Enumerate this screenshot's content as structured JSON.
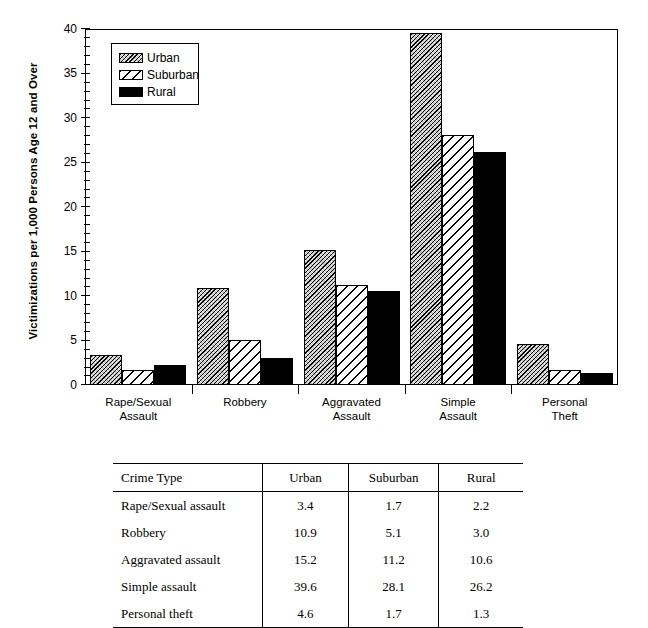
{
  "chart_data": {
    "type": "bar",
    "title": "",
    "subtitle": "",
    "xlabel": "",
    "ylabel": "Victimizations per 1,000 Persons Age 12 and Over",
    "ylim": [
      0,
      40
    ],
    "ytick_step": 5,
    "yminor_step": 1,
    "ytick_labels": [
      "0",
      "5",
      "10",
      "15",
      "20",
      "25",
      "30",
      "35",
      "40"
    ],
    "grid": false,
    "legend_position": "upper-left-inside",
    "categories": [
      "Rape/Sexual Assault",
      "Robbery",
      "Aggravated Assault",
      "Simple Assault",
      "Personal Theft"
    ],
    "category_lines": [
      [
        "Rape/Sexual",
        "Assault"
      ],
      [
        "Robbery",
        ""
      ],
      [
        "Aggravated",
        "Assault"
      ],
      [
        "Simple",
        "Assault"
      ],
      [
        "Personal",
        "Theft"
      ]
    ],
    "series": [
      {
        "name": "Urban",
        "pattern": "dense-diagonal-hatch",
        "values": [
          3.4,
          10.9,
          15.2,
          39.6,
          4.6
        ]
      },
      {
        "name": "Suburban",
        "pattern": "sparse-diagonal-hatch",
        "values": [
          1.7,
          5.1,
          11.2,
          28.1,
          1.7
        ]
      },
      {
        "name": "Rural",
        "pattern": "solid-black",
        "values": [
          2.2,
          3.0,
          10.6,
          26.2,
          1.3
        ]
      }
    ]
  },
  "legend": {
    "items": [
      {
        "label": "Urban"
      },
      {
        "label": "Suburban"
      },
      {
        "label": "Rural"
      }
    ]
  },
  "table": {
    "headers": [
      "Crime Type",
      "Urban",
      "Suburban",
      "Rural"
    ],
    "rows": [
      {
        "crime": "Rape/Sexual assault",
        "urban": "3.4",
        "suburban": "1.7",
        "rural": "2.2"
      },
      {
        "crime": "Robbery",
        "urban": "10.9",
        "suburban": "5.1",
        "rural": "3.0"
      },
      {
        "crime": "Aggravated assault",
        "urban": "15.2",
        "suburban": "11.2",
        "rural": "10.6"
      },
      {
        "crime": "Simple assault",
        "urban": "39.6",
        "suburban": "28.1",
        "rural": "26.2"
      },
      {
        "crime": "Personal theft",
        "urban": "4.6",
        "suburban": "1.7",
        "rural": "1.3"
      }
    ]
  },
  "colors": {
    "axis": "#000000",
    "rural_fill": "#000000",
    "urban_fill": "#c8c8c8",
    "suburban_fill": "#ffffff",
    "background": "#ffffff"
  }
}
